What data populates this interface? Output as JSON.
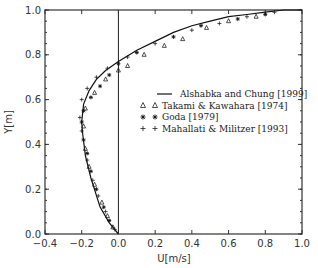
{
  "chart_data": {
    "type": "line",
    "title": "",
    "xlabel": "U[m/s]",
    "ylabel": "Y[m]",
    "xlim": [
      -0.4,
      1.0
    ],
    "ylim": [
      0.0,
      1.0
    ],
    "x_ticks": [
      "-0.4",
      "-0.2",
      "0.0",
      "0.2",
      "0.4",
      "0.6",
      "0.8",
      "1.0"
    ],
    "y_ticks": [
      "0.0",
      "0.2",
      "0.4",
      "0.6",
      "0.8",
      "1.0"
    ],
    "grid": false,
    "legend_position": "center-right",
    "reference_line": {
      "x": 0.0,
      "orientation": "vertical"
    },
    "series": [
      {
        "name": "Alshabka and Chung [1999]",
        "style": "line",
        "points": [
          [
            0.0,
            0.0
          ],
          [
            -0.05,
            0.05
          ],
          [
            -0.1,
            0.12
          ],
          [
            -0.15,
            0.25
          ],
          [
            -0.18,
            0.35
          ],
          [
            -0.195,
            0.45
          ],
          [
            -0.2,
            0.5
          ],
          [
            -0.19,
            0.58
          ],
          [
            -0.16,
            0.64
          ],
          [
            -0.12,
            0.69
          ],
          [
            -0.07,
            0.73
          ],
          [
            0.0,
            0.77
          ],
          [
            0.1,
            0.82
          ],
          [
            0.2,
            0.86
          ],
          [
            0.3,
            0.9
          ],
          [
            0.4,
            0.93
          ],
          [
            0.5,
            0.95
          ],
          [
            0.6,
            0.97
          ],
          [
            0.7,
            0.98
          ],
          [
            0.8,
            0.99
          ],
          [
            0.9,
            1.0
          ],
          [
            1.0,
            1.0
          ]
        ]
      },
      {
        "name": "Takami & Kawahara [1974]",
        "style": "triangle",
        "points": [
          [
            -0.03,
            0.03
          ],
          [
            -0.06,
            0.08
          ],
          [
            -0.09,
            0.14
          ],
          [
            -0.13,
            0.22
          ],
          [
            -0.16,
            0.3
          ],
          [
            -0.18,
            0.38
          ],
          [
            -0.19,
            0.48
          ],
          [
            -0.18,
            0.56
          ],
          [
            -0.13,
            0.63
          ],
          [
            -0.07,
            0.69
          ],
          [
            0.0,
            0.73
          ],
          [
            0.05,
            0.75
          ],
          [
            0.14,
            0.8
          ],
          [
            0.25,
            0.84
          ],
          [
            0.35,
            0.87
          ],
          [
            0.48,
            0.92
          ],
          [
            0.6,
            0.95
          ],
          [
            0.75,
            0.97
          ]
        ]
      },
      {
        "name": "Goda [1979]",
        "style": "asterisk",
        "points": [
          [
            -0.05,
            0.06
          ],
          [
            -0.08,
            0.12
          ],
          [
            -0.12,
            0.2
          ],
          [
            -0.15,
            0.28
          ],
          [
            -0.17,
            0.36
          ],
          [
            -0.19,
            0.42
          ],
          [
            -0.2,
            0.5
          ],
          [
            -0.19,
            0.55
          ],
          [
            -0.15,
            0.61
          ],
          [
            -0.1,
            0.66
          ],
          [
            -0.05,
            0.71
          ],
          [
            0.0,
            0.76
          ],
          [
            0.1,
            0.81
          ],
          [
            0.3,
            0.88
          ],
          [
            0.45,
            0.93
          ],
          [
            0.65,
            0.96
          ],
          [
            0.8,
            0.98
          ]
        ]
      },
      {
        "name": "Mahallati & Militzer [1993]",
        "style": "plus",
        "points": [
          [
            -0.02,
            0.02
          ],
          [
            -0.07,
            0.1
          ],
          [
            -0.11,
            0.17
          ],
          [
            -0.14,
            0.24
          ],
          [
            -0.17,
            0.33
          ],
          [
            -0.2,
            0.46
          ],
          [
            -0.21,
            0.52
          ],
          [
            -0.2,
            0.6
          ],
          [
            -0.17,
            0.65
          ],
          [
            -0.12,
            0.7
          ],
          [
            -0.06,
            0.74
          ],
          [
            0.05,
            0.79
          ],
          [
            0.2,
            0.85
          ],
          [
            0.4,
            0.91
          ],
          [
            0.55,
            0.94
          ],
          [
            0.7,
            0.97
          ],
          [
            0.85,
            0.99
          ]
        ]
      }
    ]
  },
  "legend": {
    "items": [
      {
        "marker": "line",
        "label": "Alshabka and Chung [1999]"
      },
      {
        "marker": "triangle",
        "label": "Takami & Kawahara [1974]"
      },
      {
        "marker": "asterisk",
        "label": "Goda [1979]"
      },
      {
        "marker": "plus",
        "label": "Mahallati & Militzer [1993]"
      }
    ]
  },
  "axes": {
    "xlabel": "U[m/s]",
    "ylabel": "Y[m]"
  }
}
